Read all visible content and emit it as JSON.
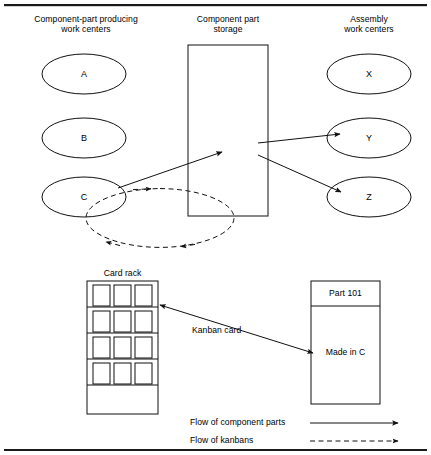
{
  "figure": {
    "background_color": "#ffffff",
    "line_color": "#111111",
    "width": 431,
    "height": 455
  },
  "columns": {
    "left": {
      "heading_line1": "Component-part producing",
      "heading_line2": "work centers"
    },
    "middle": {
      "heading_line1": "Component part",
      "heading_line2": "storage"
    },
    "right": {
      "heading_line1": "Assembly",
      "heading_line2": "work centers"
    }
  },
  "work_centers": {
    "producing": [
      {
        "label": "A"
      },
      {
        "label": "B"
      },
      {
        "label": "C"
      }
    ],
    "assembly": [
      {
        "label": "X"
      },
      {
        "label": "Y"
      },
      {
        "label": "Z"
      }
    ]
  },
  "card_rack": {
    "label": "Card rack",
    "rows": 4,
    "cards_per_row": 3,
    "empty_bottom_shelf": true
  },
  "kanban_card": {
    "annotation": "Kanban card",
    "part_number": "Part 101",
    "made_in": "Made in C"
  },
  "legend": [
    {
      "label": "Flow of component parts",
      "style": "solid"
    },
    {
      "label": "Flow of kanbans",
      "style": "dashed"
    }
  ]
}
